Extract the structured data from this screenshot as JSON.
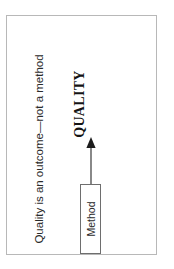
{
  "slide": {
    "title": "Quality is an outcome—not a method",
    "background_color": "#ffffff",
    "border_color": "#b8b8b8"
  },
  "diagram": {
    "type": "flow",
    "orientation": "rotated-90-ccw",
    "source_node": {
      "label": "Method",
      "shape": "rectangle",
      "border_color": "#6e6e6e",
      "fill_color": "#ffffff"
    },
    "arrow": {
      "direction": "up",
      "color": "#2b2b2b",
      "head": "solid-triangle"
    },
    "target_node": {
      "label": "QUALITY",
      "shape": "text",
      "emphasis": "bold-serif",
      "color": "#141414"
    }
  }
}
